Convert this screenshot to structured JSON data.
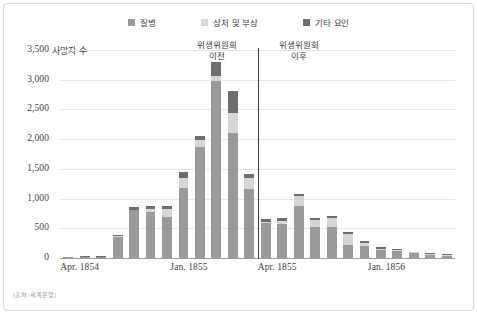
{
  "legend": {
    "items": [
      {
        "label": "질병",
        "color": "#9a9a9a",
        "key": "disease"
      },
      {
        "label": "상처 및 부상",
        "color": "#d6d6d6",
        "key": "wounds"
      },
      {
        "label": "기타 요인",
        "color": "#6e6e6e",
        "key": "other"
      }
    ]
  },
  "axis": {
    "y_label": "사망자 수",
    "y_ticks": [
      "3,500",
      "3,000",
      "2,500",
      "2,000",
      "1,500",
      "1,000",
      "500",
      "0"
    ],
    "y_tick_values": [
      3500,
      3000,
      2500,
      2000,
      1500,
      1000,
      500,
      0
    ],
    "x_ticks": [
      "Apr. 1854",
      "Jan. 1855",
      "Apr. 1855",
      "Jan. 1856"
    ]
  },
  "annotations": [
    {
      "name": "before-sanitary-commission",
      "line1": "위생위원회",
      "line2": "이전"
    },
    {
      "name": "after-sanitary-commission",
      "line1": "위생위원회",
      "line2": "이후"
    }
  ],
  "source": "(출처: 세계은행)",
  "chart_data": {
    "type": "bar",
    "title": "",
    "subtitle": "",
    "xlabel": "",
    "ylabel": "사망자 수",
    "ylim": [
      0,
      3500
    ],
    "grid": true,
    "stacked": true,
    "legend_position": "top-center",
    "divider_after_index": 11,
    "divider_label_left": "위생위원회 이전",
    "divider_label_right": "위생위원회 이후",
    "categories": [
      "Apr. 1854",
      "May 1854",
      "Jun. 1854",
      "Jul. 1854",
      "Aug. 1854",
      "Sep. 1854",
      "Oct. 1854",
      "Nov. 1854",
      "Dec. 1854",
      "Jan. 1855",
      "Feb. 1855",
      "Mar. 1855",
      "Apr. 1855",
      "May 1855",
      "Jun. 1855",
      "Jul. 1855",
      "Aug. 1855",
      "Sep. 1855",
      "Oct. 1855",
      "Nov. 1855",
      "Dec. 1855",
      "Jan. 1856",
      "Feb. 1856",
      "Mar. 1856"
    ],
    "series": [
      {
        "name": "질병",
        "color": "#9a9a9a",
        "values": [
          5,
          20,
          20,
          360,
          800,
          780,
          690,
          1180,
          1860,
          2980,
          2110,
          1160,
          590,
          580,
          870,
          520,
          530,
          220,
          200,
          130,
          110,
          80,
          50,
          35
        ]
      },
      {
        "name": "상처 및 부상",
        "color": "#d6d6d6",
        "values": [
          0,
          0,
          0,
          5,
          10,
          50,
          130,
          170,
          120,
          90,
          330,
          180,
          20,
          40,
          170,
          120,
          140,
          180,
          60,
          30,
          20,
          15,
          10,
          5
        ]
      },
      {
        "name": "기타 요인",
        "color": "#6e6e6e",
        "values": [
          0,
          5,
          5,
          10,
          40,
          40,
          60,
          90,
          80,
          230,
          370,
          70,
          40,
          50,
          40,
          40,
          40,
          30,
          30,
          20,
          20,
          10,
          10,
          5
        ]
      }
    ]
  }
}
